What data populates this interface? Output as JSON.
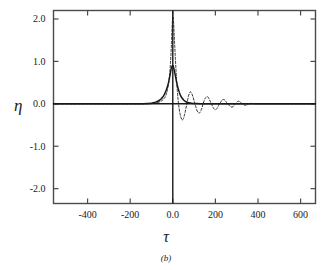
{
  "chart_data": {
    "type": "line",
    "title": "",
    "subtitle": "",
    "caption": "(b)",
    "xlabel": "τ",
    "ylabel": "η",
    "xlim": [
      -560,
      670
    ],
    "ylim": [
      -2.35,
      2.2
    ],
    "grid": false,
    "legend": "none",
    "xticks": [
      -400,
      -200,
      0,
      200,
      400,
      600
    ],
    "xticklabels": [
      "-400",
      "-200",
      "0.0",
      "200",
      "400",
      "600"
    ],
    "yticks": [
      2.0,
      1.0,
      0.0,
      -1.0,
      -2.0
    ],
    "yticklabels": [
      "2.0",
      "1.0",
      "0.0",
      "-1.0",
      "-2.0"
    ],
    "zero_line_y": 0.0,
    "zero_line_x": 0.0,
    "series": [
      {
        "name": "solid",
        "style": "solid",
        "color": "#1a1a1a",
        "points": [
          [
            -560,
            0.0
          ],
          [
            -400,
            0.0
          ],
          [
            -250,
            0.0
          ],
          [
            -160,
            0.0
          ],
          [
            -120,
            0.005
          ],
          [
            -100,
            0.015
          ],
          [
            -90,
            0.025
          ],
          [
            -80,
            0.04
          ],
          [
            -70,
            0.06
          ],
          [
            -62,
            0.085
          ],
          [
            -55,
            0.115
          ],
          [
            -48,
            0.155
          ],
          [
            -42,
            0.2
          ],
          [
            -36,
            0.26
          ],
          [
            -30,
            0.33
          ],
          [
            -25,
            0.41
          ],
          [
            -20,
            0.5
          ],
          [
            -16,
            0.6
          ],
          [
            -12,
            0.7
          ],
          [
            -9,
            0.79
          ],
          [
            -6,
            0.86
          ],
          [
            -3,
            0.895
          ],
          [
            0,
            0.9
          ],
          [
            3,
            0.875
          ],
          [
            6,
            0.82
          ],
          [
            9,
            0.74
          ],
          [
            13,
            0.64
          ],
          [
            17,
            0.53
          ],
          [
            22,
            0.42
          ],
          [
            27,
            0.33
          ],
          [
            32,
            0.25
          ],
          [
            38,
            0.18
          ],
          [
            45,
            0.125
          ],
          [
            52,
            0.085
          ],
          [
            60,
            0.055
          ],
          [
            70,
            0.032
          ],
          [
            82,
            0.018
          ],
          [
            95,
            0.01
          ],
          [
            110,
            0.005
          ],
          [
            130,
            0.002
          ],
          [
            160,
            0.0
          ],
          [
            250,
            0.0
          ],
          [
            400,
            0.0
          ],
          [
            560,
            0.0
          ],
          [
            670,
            0.0
          ]
        ]
      },
      {
        "name": "dashed",
        "style": "dashed",
        "color": "#1a1a1a",
        "points": [
          [
            -560,
            0.0
          ],
          [
            -300,
            0.0
          ],
          [
            -160,
            0.0
          ],
          [
            -120,
            0.0
          ],
          [
            -100,
            0.005
          ],
          [
            -88,
            0.012
          ],
          [
            -78,
            0.022
          ],
          [
            -68,
            0.035
          ],
          [
            -60,
            0.05
          ],
          [
            -53,
            0.07
          ],
          [
            -46,
            0.095
          ],
          [
            -40,
            0.13
          ],
          [
            -34,
            0.18
          ],
          [
            -29,
            0.25
          ],
          [
            -25,
            0.33
          ],
          [
            -21,
            0.44
          ],
          [
            -17,
            0.58
          ],
          [
            -14,
            0.74
          ],
          [
            -11,
            0.95
          ],
          [
            -8,
            1.2
          ],
          [
            -6,
            1.45
          ],
          [
            -4,
            1.7
          ],
          [
            -2,
            1.92
          ],
          [
            0,
            2.05
          ],
          [
            2,
            2.04
          ],
          [
            4,
            1.9
          ],
          [
            6,
            1.68
          ],
          [
            9,
            1.38
          ],
          [
            12,
            1.08
          ],
          [
            15,
            0.8
          ],
          [
            18,
            0.55
          ],
          [
            21,
            0.33
          ],
          [
            24,
            0.14
          ],
          [
            27,
            0.0
          ],
          [
            30,
            -0.12
          ],
          [
            34,
            -0.24
          ],
          [
            38,
            -0.32
          ],
          [
            42,
            -0.37
          ],
          [
            46,
            -0.38
          ],
          [
            50,
            -0.35
          ],
          [
            54,
            -0.28
          ],
          [
            58,
            -0.2
          ],
          [
            62,
            -0.1
          ],
          [
            66,
            0.0
          ],
          [
            70,
            0.1
          ],
          [
            74,
            0.19
          ],
          [
            78,
            0.25
          ],
          [
            82,
            0.28
          ],
          [
            86,
            0.27
          ],
          [
            90,
            0.23
          ],
          [
            95,
            0.16
          ],
          [
            100,
            0.07
          ],
          [
            104,
            0.0
          ],
          [
            108,
            -0.07
          ],
          [
            113,
            -0.15
          ],
          [
            118,
            -0.2
          ],
          [
            123,
            -0.22
          ],
          [
            128,
            -0.2
          ],
          [
            133,
            -0.15
          ],
          [
            138,
            -0.08
          ],
          [
            142,
            0.0
          ],
          [
            147,
            0.07
          ],
          [
            152,
            0.13
          ],
          [
            157,
            0.16
          ],
          [
            162,
            0.17
          ],
          [
            167,
            0.15
          ],
          [
            172,
            0.1
          ],
          [
            177,
            0.04
          ],
          [
            181,
            0.0
          ],
          [
            186,
            -0.05
          ],
          [
            191,
            -0.1
          ],
          [
            196,
            -0.13
          ],
          [
            201,
            -0.14
          ],
          [
            206,
            -0.12
          ],
          [
            211,
            -0.08
          ],
          [
            216,
            -0.03
          ],
          [
            220,
            0.0
          ],
          [
            225,
            0.04
          ],
          [
            230,
            0.08
          ],
          [
            235,
            0.1
          ],
          [
            240,
            0.1
          ],
          [
            245,
            0.085
          ],
          [
            250,
            0.05
          ],
          [
            255,
            0.015
          ],
          [
            259,
            0.0
          ],
          [
            264,
            -0.03
          ],
          [
            269,
            -0.06
          ],
          [
            274,
            -0.075
          ],
          [
            279,
            -0.075
          ],
          [
            284,
            -0.06
          ],
          [
            289,
            -0.03
          ],
          [
            293,
            0.0
          ],
          [
            298,
            0.025
          ],
          [
            303,
            0.05
          ],
          [
            308,
            0.06
          ],
          [
            313,
            0.055
          ],
          [
            318,
            0.035
          ],
          [
            323,
            0.012
          ],
          [
            327,
            0.0
          ],
          [
            332,
            -0.015
          ],
          [
            337,
            -0.03
          ],
          [
            342,
            -0.035
          ],
          [
            347,
            -0.03
          ],
          [
            352,
            -0.015
          ],
          [
            356,
            0.0
          ],
          [
            362,
            0.008
          ],
          [
            368,
            0.012
          ],
          [
            374,
            0.008
          ],
          [
            380,
            0.0
          ],
          [
            400,
            0.0
          ],
          [
            450,
            0.0
          ],
          [
            520,
            0.0
          ],
          [
            600,
            0.0
          ],
          [
            670,
            0.0
          ]
        ]
      }
    ]
  },
  "axes": {
    "frame_color": "#4a4a4a",
    "line_color": "#1a1a1a"
  }
}
